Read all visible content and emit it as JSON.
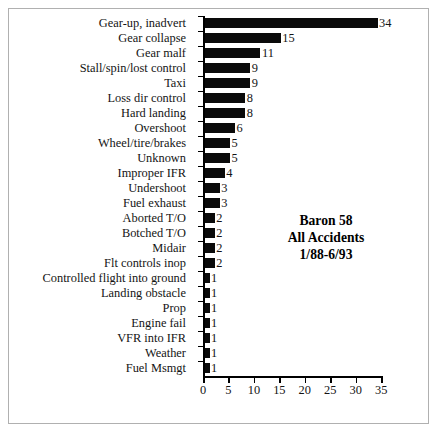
{
  "chart_data": {
    "type": "bar",
    "orientation": "horizontal",
    "title": "",
    "xlabel": "",
    "ylabel": "",
    "xlim": [
      0,
      35
    ],
    "xticks": [
      0,
      5,
      10,
      15,
      20,
      25,
      30,
      35
    ],
    "grid": false,
    "legend": null,
    "annotations": [
      "Baron 58",
      "All Accidents",
      "1/88-6/93"
    ],
    "categories": [
      "Gear-up, inadvert",
      "Gear collapse",
      "Gear malf",
      "Stall/spin/lost control",
      "Taxi",
      "Loss dir control",
      "Hard landing",
      "Overshoot",
      "Wheel/tire/brakes",
      "Unknown",
      "Improper IFR",
      "Undershoot",
      "Fuel exhaust",
      "Aborted T/O",
      "Botched T/O",
      "Midair",
      "Flt controls inop",
      "Controlled flight into ground",
      "Landing obstacle",
      "Prop",
      "Engine fail",
      "VFR into IFR",
      "Weather",
      "Fuel Msmgt"
    ],
    "values": [
      34,
      15,
      11,
      9,
      9,
      8,
      8,
      6,
      5,
      5,
      4,
      3,
      3,
      2,
      2,
      2,
      2,
      1,
      1,
      1,
      1,
      1,
      1,
      1
    ],
    "bar_color": "#0a0a0a",
    "axis_color": "#000000",
    "background": "#ffffff",
    "frame_color": "#b0b0b0"
  },
  "annotation": {
    "line1": "Baron 58",
    "line2": "All Accidents",
    "line3": "1/88-6/93"
  }
}
